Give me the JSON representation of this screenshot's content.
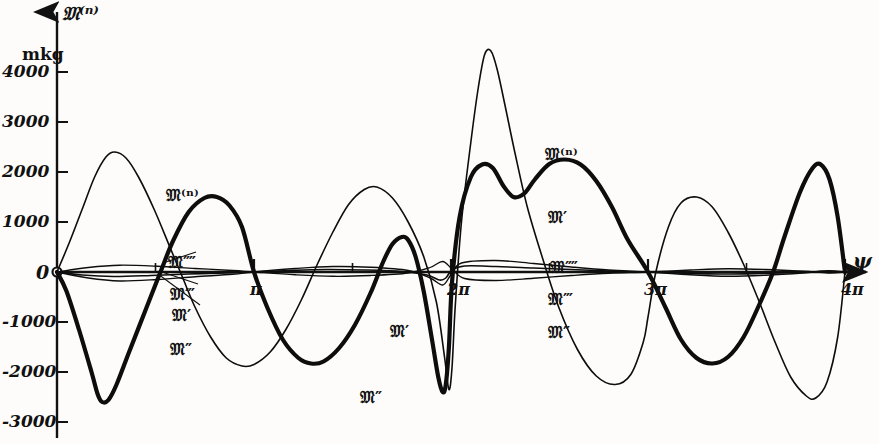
{
  "chart_data": {
    "type": "line",
    "title": "",
    "xlabel": "ψ",
    "ylabel": "𝔐⁽ⁿ⁾",
    "yunit": "mkg",
    "xlim": [
      0,
      12.566
    ],
    "ylim": [
      -3000,
      4600
    ],
    "grid": false,
    "legend_position": "inline-annotations",
    "yticks": [
      {
        "value": 4000,
        "label": "4000"
      },
      {
        "value": 3000,
        "label": "3000"
      },
      {
        "value": 2000,
        "label": "2000"
      },
      {
        "value": 1000,
        "label": "1000"
      },
      {
        "value": 0,
        "label": "0"
      },
      {
        "value": -1000,
        "label": "-1000"
      },
      {
        "value": -2000,
        "label": "-2000"
      },
      {
        "value": -3000,
        "label": "-3000"
      }
    ],
    "xticks": [
      {
        "value": 3.1416,
        "label": "π"
      },
      {
        "value": 6.2832,
        "label": "2π"
      },
      {
        "value": 9.4248,
        "label": "3π"
      },
      {
        "value": 12.566,
        "label": "4π"
      }
    ],
    "series": [
      {
        "name": "𝔐⁽ⁿ⁾",
        "label": "M(n)",
        "style": "thick",
        "width": 4.2,
        "color": "#0d0d0d",
        "points": [
          [
            0,
            0
          ],
          [
            0.15,
            -380
          ],
          [
            0.35,
            -1150
          ],
          [
            0.55,
            -2000
          ],
          [
            0.65,
            -2450
          ],
          [
            0.72,
            -2600
          ],
          [
            0.82,
            -2560
          ],
          [
            0.95,
            -2250
          ],
          [
            1.15,
            -1600
          ],
          [
            1.4,
            -800
          ],
          [
            1.65,
            0
          ],
          [
            1.85,
            620
          ],
          [
            2.1,
            1200
          ],
          [
            2.35,
            1480
          ],
          [
            2.55,
            1500
          ],
          [
            2.75,
            1330
          ],
          [
            2.95,
            900
          ],
          [
            3.1416,
            0
          ],
          [
            3.35,
            -700
          ],
          [
            3.6,
            -1350
          ],
          [
            3.85,
            -1720
          ],
          [
            4.05,
            -1830
          ],
          [
            4.25,
            -1790
          ],
          [
            4.5,
            -1520
          ],
          [
            4.75,
            -1060
          ],
          [
            5.0,
            -420
          ],
          [
            5.2,
            200
          ],
          [
            5.35,
            560
          ],
          [
            5.5,
            700
          ],
          [
            5.6,
            640
          ],
          [
            5.72,
            300
          ],
          [
            5.85,
            -400
          ],
          [
            5.98,
            -1350
          ],
          [
            6.08,
            -2100
          ],
          [
            6.15,
            -2400
          ],
          [
            6.2,
            -2250
          ],
          [
            6.25,
            -1500
          ],
          [
            6.3,
            -200
          ],
          [
            6.42,
            1100
          ],
          [
            6.6,
            1900
          ],
          [
            6.78,
            2150
          ],
          [
            6.95,
            2080
          ],
          [
            7.12,
            1720
          ],
          [
            7.28,
            1500
          ],
          [
            7.45,
            1570
          ],
          [
            7.62,
            1850
          ],
          [
            7.85,
            2160
          ],
          [
            8.1,
            2250
          ],
          [
            8.35,
            2150
          ],
          [
            8.6,
            1820
          ],
          [
            8.85,
            1300
          ],
          [
            9.1,
            650
          ],
          [
            9.4248,
            0
          ],
          [
            9.7,
            -700
          ],
          [
            9.95,
            -1350
          ],
          [
            10.2,
            -1720
          ],
          [
            10.45,
            -1830
          ],
          [
            10.7,
            -1700
          ],
          [
            10.95,
            -1300
          ],
          [
            11.2,
            -650
          ],
          [
            11.42,
            0
          ],
          [
            11.6,
            700
          ],
          [
            11.85,
            1600
          ],
          [
            12.05,
            2080
          ],
          [
            12.18,
            2150
          ],
          [
            12.32,
            1850
          ],
          [
            12.45,
            1100
          ],
          [
            12.566,
            0
          ]
        ]
      },
      {
        "name": "𝔐′",
        "label": "M'",
        "style": "thin",
        "width": 1.6,
        "color": "#0d0d0d",
        "points": [
          [
            0,
            0
          ],
          [
            0.2,
            600
          ],
          [
            0.4,
            1250
          ],
          [
            0.6,
            1900
          ],
          [
            0.78,
            2300
          ],
          [
            0.92,
            2400
          ],
          [
            1.1,
            2280
          ],
          [
            1.3,
            1900
          ],
          [
            1.55,
            1250
          ],
          [
            1.8,
            500
          ],
          [
            2.0,
            -100
          ],
          [
            2.2,
            -700
          ],
          [
            2.45,
            -1300
          ],
          [
            2.7,
            -1720
          ],
          [
            2.95,
            -1880
          ],
          [
            3.1416,
            -1850
          ],
          [
            3.4,
            -1600
          ],
          [
            3.65,
            -1150
          ],
          [
            3.9,
            -550
          ],
          [
            4.15,
            150
          ],
          [
            4.4,
            800
          ],
          [
            4.65,
            1350
          ],
          [
            4.9,
            1650
          ],
          [
            5.1,
            1700
          ],
          [
            5.35,
            1480
          ],
          [
            5.6,
            1000
          ],
          [
            5.85,
            300
          ],
          [
            6.05,
            -600
          ],
          [
            6.18,
            -1700
          ],
          [
            6.25,
            -2350
          ],
          [
            6.3,
            -1900
          ],
          [
            6.35,
            -700
          ],
          [
            6.45,
            1000
          ],
          [
            6.6,
            2600
          ],
          [
            6.72,
            3700
          ],
          [
            6.82,
            4350
          ],
          [
            6.92,
            4420
          ],
          [
            7.02,
            4050
          ],
          [
            7.15,
            3300
          ],
          [
            7.3,
            2400
          ],
          [
            7.5,
            1300
          ],
          [
            7.75,
            250
          ],
          [
            8.0,
            -700
          ],
          [
            8.3,
            -1550
          ],
          [
            8.6,
            -2080
          ],
          [
            8.9,
            -2250
          ],
          [
            9.15,
            -2050
          ],
          [
            9.35,
            -1400
          ],
          [
            9.4248,
            -900
          ],
          [
            9.55,
            0
          ],
          [
            9.75,
            900
          ],
          [
            9.95,
            1380
          ],
          [
            10.2,
            1500
          ],
          [
            10.45,
            1300
          ],
          [
            10.7,
            800
          ],
          [
            10.95,
            150
          ],
          [
            11.2,
            -600
          ],
          [
            11.45,
            -1400
          ],
          [
            11.7,
            -2100
          ],
          [
            11.95,
            -2480
          ],
          [
            12.1,
            -2520
          ],
          [
            12.28,
            -2200
          ],
          [
            12.45,
            -1300
          ],
          [
            12.566,
            0
          ]
        ]
      },
      {
        "name": "𝔐″",
        "label": "M''",
        "style": "thin",
        "width": 1.6,
        "color": "#0d0d0d",
        "points": [
          [
            0,
            0
          ],
          [
            0.4,
            -60
          ],
          [
            0.9,
            -90
          ],
          [
            1.5,
            -70
          ],
          [
            2.1,
            -40
          ],
          [
            2.7,
            -20
          ],
          [
            3.1416,
            0
          ],
          [
            3.7,
            30
          ],
          [
            4.3,
            50
          ],
          [
            4.9,
            40
          ],
          [
            5.5,
            10
          ],
          [
            5.9,
            -60
          ],
          [
            6.1,
            -160
          ],
          [
            6.2,
            -120
          ],
          [
            6.3,
            40
          ],
          [
            6.5,
            120
          ],
          [
            7.0,
            110
          ],
          [
            7.6,
            80
          ],
          [
            8.2,
            50
          ],
          [
            8.8,
            20
          ],
          [
            9.4248,
            0
          ],
          [
            10.0,
            -25
          ],
          [
            10.6,
            -40
          ],
          [
            11.2,
            -30
          ],
          [
            11.8,
            -10
          ],
          [
            12.2,
            10
          ],
          [
            12.566,
            0
          ]
        ]
      },
      {
        "name": "𝔐‴",
        "label": "M'''",
        "style": "thin",
        "width": 1.4,
        "color": "#0d0d0d",
        "points": [
          [
            0,
            0
          ],
          [
            0.5,
            -120
          ],
          [
            1.0,
            -180
          ],
          [
            1.6,
            -150
          ],
          [
            2.2,
            -95
          ],
          [
            2.8,
            -45
          ],
          [
            3.1416,
            0
          ],
          [
            3.8,
            70
          ],
          [
            4.4,
            110
          ],
          [
            5.0,
            95
          ],
          [
            5.6,
            30
          ],
          [
            5.95,
            -120
          ],
          [
            6.15,
            -260
          ],
          [
            6.28,
            -60
          ],
          [
            6.45,
            180
          ],
          [
            7.0,
            230
          ],
          [
            7.6,
            170
          ],
          [
            8.2,
            100
          ],
          [
            8.8,
            40
          ],
          [
            9.4248,
            0
          ],
          [
            10.1,
            -55
          ],
          [
            10.7,
            -85
          ],
          [
            11.3,
            -65
          ],
          [
            11.9,
            -20
          ],
          [
            12.3,
            25
          ],
          [
            12.566,
            0
          ]
        ]
      },
      {
        "name": "𝔐⁗",
        "label": "M''''",
        "style": "thin",
        "width": 1.3,
        "color": "#0d0d0d",
        "points": [
          [
            0,
            0
          ],
          [
            0.5,
            90
          ],
          [
            1.0,
            135
          ],
          [
            1.6,
            115
          ],
          [
            2.2,
            70
          ],
          [
            2.8,
            30
          ],
          [
            3.1416,
            0
          ],
          [
            3.8,
            -55
          ],
          [
            4.4,
            -85
          ],
          [
            5.0,
            -70
          ],
          [
            5.6,
            -20
          ],
          [
            5.95,
            90
          ],
          [
            6.15,
            210
          ],
          [
            6.3,
            60
          ],
          [
            6.5,
            -130
          ],
          [
            7.0,
            -170
          ],
          [
            7.6,
            -125
          ],
          [
            8.2,
            -70
          ],
          [
            8.8,
            -25
          ],
          [
            9.4248,
            0
          ],
          [
            10.1,
            40
          ],
          [
            10.7,
            65
          ],
          [
            11.3,
            50
          ],
          [
            11.9,
            15
          ],
          [
            12.3,
            -20
          ],
          [
            12.566,
            0
          ]
        ]
      }
    ],
    "annotations": [
      {
        "text": "𝔐⁽ⁿ⁾",
        "x_px": 166,
        "y_px": 186,
        "group": "left"
      },
      {
        "text": "𝔐⁗",
        "x_px": 168,
        "y_px": 253,
        "group": "left"
      },
      {
        "text": "𝔐‴",
        "x_px": 170,
        "y_px": 285,
        "group": "left"
      },
      {
        "text": "𝔐′",
        "x_px": 172,
        "y_px": 306,
        "group": "left"
      },
      {
        "text": "𝔐″",
        "x_px": 170,
        "y_px": 340,
        "group": "left"
      },
      {
        "text": "𝔐⁽ⁿ⁾",
        "x_px": 545,
        "y_px": 145,
        "group": "right"
      },
      {
        "text": "𝔐′",
        "x_px": 548,
        "y_px": 208,
        "group": "right"
      },
      {
        "text": "𝔐⁗",
        "x_px": 550,
        "y_px": 258,
        "group": "right"
      },
      {
        "text": "𝔐‴",
        "x_px": 548,
        "y_px": 290,
        "group": "right"
      },
      {
        "text": "𝔐″",
        "x_px": 548,
        "y_px": 323,
        "group": "right"
      },
      {
        "text": "𝔐′",
        "x_px": 390,
        "y_px": 322,
        "group": "mid"
      },
      {
        "text": "𝔐″",
        "x_px": 360,
        "y_px": 388,
        "group": "mid"
      }
    ]
  }
}
